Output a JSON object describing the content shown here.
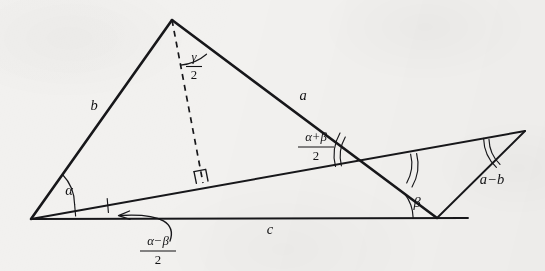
{
  "figure": {
    "kind": "euclidean-geometry-diagram",
    "background_color": "#f2f1ef",
    "ink_color": "#17171a"
  },
  "vertices": {
    "apex": {
      "name": "apex",
      "x": 172,
      "y": 20
    },
    "left": {
      "name": "left-vertex",
      "x": 31,
      "y": 219
    },
    "bottom_right": {
      "name": "bottom-right-vertex",
      "x": 437,
      "y": 218
    },
    "base_right_end": {
      "name": "base-right-end",
      "x": 468,
      "y": 218
    },
    "far_right_tip": {
      "name": "far-right-tip",
      "x": 525,
      "y": 131
    },
    "intersection": {
      "name": "intersection-point",
      "x": 376,
      "y": 160
    },
    "altitude_foot": {
      "name": "altitude-foot",
      "x": 203,
      "y": 183
    }
  },
  "labels": {
    "side_b": "b",
    "side_a": "a",
    "side_c": "c",
    "side_a_minus_b": "a−b",
    "angle_alpha": "α",
    "angle_beta": "β",
    "gamma_over_two": {
      "numerator": "γ",
      "denominator": "2"
    },
    "alpha_plus_beta_over_two": {
      "numerator": "α+β",
      "denominator": "2"
    },
    "alpha_minus_beta_over_two": {
      "numerator": "α−β",
      "denominator": "2"
    }
  },
  "label_positions": {
    "side_b": {
      "x": 94,
      "y": 107
    },
    "side_a": {
      "x": 303,
      "y": 97
    },
    "side_c": {
      "x": 270,
      "y": 231
    },
    "side_a_minus_b": {
      "x": 492,
      "y": 181
    },
    "angle_alpha": {
      "x": 69,
      "y": 192
    },
    "angle_beta": {
      "x": 417,
      "y": 204
    },
    "gamma_frac": {
      "x": 194,
      "y": 65
    },
    "alpha_plus_beta_frac": {
      "x": 316,
      "y": 145
    },
    "alpha_minus_beta_frac": {
      "x": 158,
      "y": 249
    }
  },
  "angle_marks": [
    {
      "name": "alpha-arc",
      "vertex": "left",
      "arcs": 1,
      "label": "α"
    },
    {
      "name": "beta-arc",
      "vertex": "bottom_right",
      "arcs": 1,
      "label": "β"
    },
    {
      "name": "gamma-half-arc",
      "vertex": "apex",
      "arcs": 1,
      "label": "γ/2"
    },
    {
      "name": "alpha-minus-beta-ticks",
      "vertex": "left",
      "arcs": 2,
      "label": "(α−β)/2"
    },
    {
      "name": "intersection-arc-left",
      "vertex": "intersection",
      "arcs": 2,
      "label": "(α+β)/2"
    },
    {
      "name": "intersection-arc-right",
      "vertex": "intersection",
      "arcs": 2,
      "label": "(α+β)/2"
    },
    {
      "name": "far-right-tip-arc",
      "vertex": "far_right_tip",
      "arcs": 2,
      "label": "(α+β)/2"
    }
  ],
  "right_angle_marker": {
    "name": "right-angle-square",
    "x": 203,
    "y": 183,
    "size": 12
  },
  "arrow": {
    "name": "alpha-minus-beta-pointer",
    "from": {
      "x": 172,
      "y": 240
    },
    "to": {
      "x": 118,
      "y": 216
    }
  }
}
